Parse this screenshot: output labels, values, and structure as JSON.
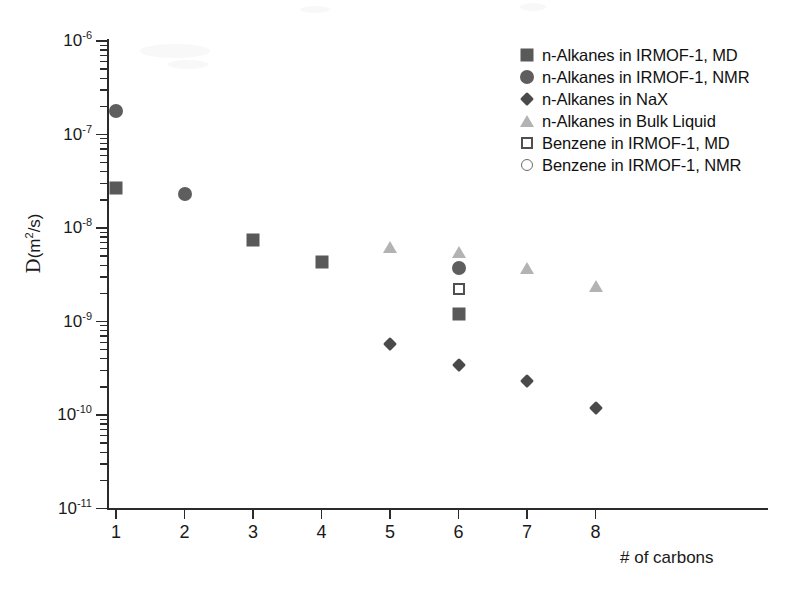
{
  "chart_data": {
    "type": "scatter",
    "title": "",
    "xlabel": "# of carbons",
    "ylabel": "D(m2/s)",
    "xlim": [
      1,
      8
    ],
    "ylim": [
      1e-11,
      1e-06
    ],
    "yscale": "log",
    "grid": false,
    "legend_position": "top-right",
    "xticks": [
      1,
      2,
      3,
      4,
      5,
      6,
      7,
      8
    ],
    "yticks": [
      "1e-6",
      "1e-7",
      "1e-8",
      "1e-9",
      "1e-10",
      "1e-11"
    ],
    "ytick_labels": [
      {
        "mantissa": "10",
        "exponent": "-6"
      },
      {
        "mantissa": "10",
        "exponent": "-7"
      },
      {
        "mantissa": "10",
        "exponent": "-8"
      },
      {
        "mantissa": "10",
        "exponent": "-9"
      },
      {
        "mantissa": "10",
        "exponent": "-10"
      },
      {
        "mantissa": "10",
        "exponent": "-11"
      }
    ],
    "series": [
      {
        "name": "n-Alkanes in IRMOF-1, MD",
        "marker": "filled-square",
        "color": "#595959",
        "points": [
          {
            "x": 1,
            "y": 2.7e-08
          },
          {
            "x": 3,
            "y": 7.5e-09
          },
          {
            "x": 4,
            "y": 4.3e-09
          },
          {
            "x": 6,
            "y": 1.2e-09
          }
        ]
      },
      {
        "name": "n-Alkanes in IRMOF-1, NMR",
        "marker": "filled-circle",
        "color": "#5e5e5e",
        "points": [
          {
            "x": 1,
            "y": 1.8e-07
          },
          {
            "x": 2,
            "y": 2.3e-08
          },
          {
            "x": 6,
            "y": 3.7e-09
          }
        ]
      },
      {
        "name": "n-Alkanes in NaX",
        "marker": "filled-diamond",
        "color": "#4a4a4a",
        "points": [
          {
            "x": 5,
            "y": 5.7e-10
          },
          {
            "x": 6,
            "y": 3.4e-10
          },
          {
            "x": 7,
            "y": 2.3e-10
          },
          {
            "x": 8,
            "y": 1.2e-10
          }
        ]
      },
      {
        "name": "n-Alkanes in Bulk Liquid",
        "marker": "filled-triangle",
        "color": "#b3b3b3",
        "points": [
          {
            "x": 5,
            "y": 6.2e-09
          },
          {
            "x": 6,
            "y": 5.6e-09
          },
          {
            "x": 7,
            "y": 3.7e-09
          },
          {
            "x": 8,
            "y": 2.4e-09
          }
        ]
      },
      {
        "name": "Benzene in IRMOF-1, MD",
        "marker": "open-square",
        "color": "#4f4f4f",
        "points": [
          {
            "x": 6,
            "y": 2.2e-09
          }
        ]
      },
      {
        "name": "Benzene in IRMOF-1, NMR",
        "marker": "open-circle",
        "color": "#6b6b6b",
        "points": []
      }
    ]
  },
  "axes": {
    "y_title_prefix": "",
    "y_title_script": "D",
    "y_title_open": "(m",
    "y_title_sup": "2",
    "y_title_close": "/s)",
    "x_title": "# of carbons"
  },
  "legend": {
    "entries": [
      {
        "label": "n-Alkanes in IRMOF-1, MD",
        "marker": "filled-square"
      },
      {
        "label": "n-Alkanes in IRMOF-1, NMR",
        "marker": "filled-circle"
      },
      {
        "label": "n-Alkanes in NaX",
        "marker": "filled-diamond"
      },
      {
        "label": "n-Alkanes in Bulk Liquid",
        "marker": "filled-triangle"
      },
      {
        "label": "Benzene in IRMOF-1, MD",
        "marker": "open-square"
      },
      {
        "label": "Benzene in IRMOF-1, NMR",
        "marker": "open-circle"
      }
    ]
  }
}
